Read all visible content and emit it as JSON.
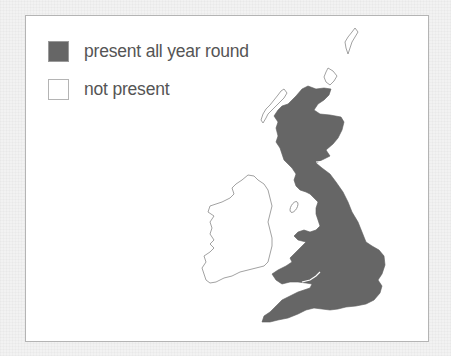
{
  "legend": {
    "items": [
      {
        "label": "present all year round",
        "color": "#666666",
        "style": "filled"
      },
      {
        "label": "not present",
        "color": "#ffffff",
        "style": "outline"
      }
    ]
  },
  "map": {
    "regions": [
      {
        "name": "Great Britain",
        "status": "present all year round",
        "fill": "#666666"
      },
      {
        "name": "Ireland",
        "status": "not present",
        "fill": "#ffffff"
      },
      {
        "name": "Outer Hebrides",
        "status": "not present",
        "fill": "#ffffff"
      },
      {
        "name": "Orkney",
        "status": "not present",
        "fill": "#ffffff"
      },
      {
        "name": "Shetland",
        "status": "not present",
        "fill": "#ffffff"
      },
      {
        "name": "Isle of Man",
        "status": "not present",
        "fill": "#ffffff"
      }
    ]
  }
}
